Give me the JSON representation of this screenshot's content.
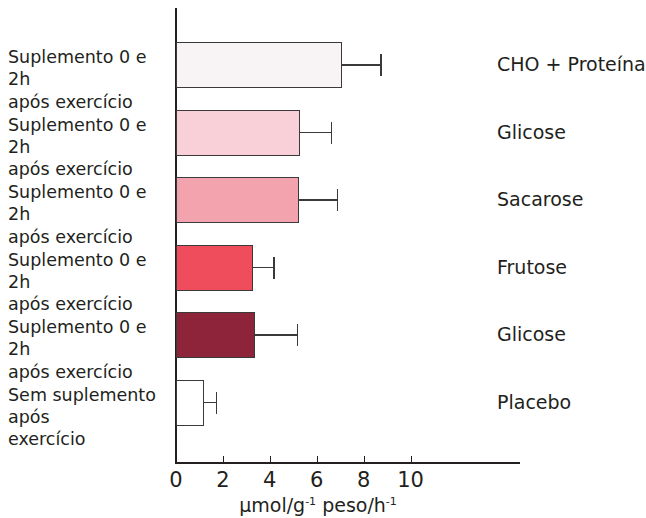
{
  "chart_data": {
    "type": "bar",
    "orientation": "horizontal",
    "title": "",
    "xlabel": "μmol/g-1 peso/h-1",
    "xlabel_parts": {
      "prefix": "μmol/g",
      "sup1": "-1",
      "middle": " peso/h",
      "sup2": "-1"
    },
    "ylabel": "",
    "xlim": [
      0,
      11
    ],
    "xticks": [
      0,
      2,
      4,
      6,
      8,
      10
    ],
    "xtick_labels": [
      "0",
      "2",
      "4",
      "6",
      "8",
      "10"
    ],
    "grid": false,
    "legend": "right-of-bars",
    "categories": [
      "CHO + Proteína",
      "Glicose",
      "Sacarose",
      "Frutose",
      "Glicose",
      "Placebo"
    ],
    "values": [
      7.1,
      5.3,
      5.25,
      3.3,
      3.35,
      1.2
    ],
    "errors": [
      1.6,
      1.3,
      1.6,
      0.85,
      1.8,
      0.5
    ],
    "bar_colors": [
      "#f8f4f6",
      "#f9cfd8",
      "#f3a3ae",
      "#ef4c5c",
      "#8e2439",
      "#ffffff"
    ],
    "bar_edge_color": "#3a3a3a",
    "condition_labels": [
      "Suplemento 0 e 2h\napós exercício",
      "Suplemento 0 e 2h\napós exercício",
      "Suplemento 0 e 2h\napós exercício",
      "Suplemento 0 e 2h\napós exercício",
      "Suplemento 0 e 2h\napós exercício",
      "Sem suplemento após\nexercício"
    ]
  }
}
